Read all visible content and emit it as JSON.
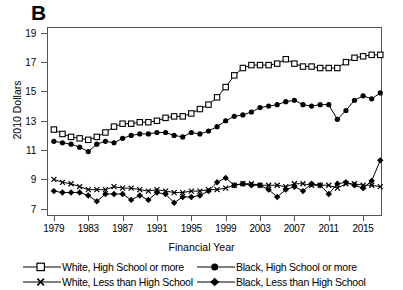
{
  "panel_label": "B",
  "chart_data": {
    "type": "line",
    "title": "B",
    "xlabel": "Financial Year",
    "ylabel": "2010 Dollars",
    "xlim": [
      1978.2,
      2017.2
    ],
    "ylim": [
      6.5,
      19.4
    ],
    "grid": false,
    "legend_position": "bottom",
    "xticks": [
      1979,
      1983,
      1987,
      1991,
      1995,
      1999,
      2003,
      2007,
      2011,
      2015
    ],
    "yticks": [
      7,
      9,
      11,
      13,
      15,
      17,
      19
    ],
    "x": [
      1979,
      1980,
      1981,
      1982,
      1983,
      1984,
      1985,
      1986,
      1987,
      1988,
      1989,
      1990,
      1991,
      1992,
      1993,
      1994,
      1995,
      1996,
      1997,
      1998,
      1999,
      2000,
      2001,
      2002,
      2003,
      2004,
      2005,
      2006,
      2007,
      2008,
      2009,
      2010,
      2011,
      2012,
      2013,
      2014,
      2015,
      2016,
      2017
    ],
    "series": [
      {
        "name": "White, High School or more",
        "marker": "open-square",
        "values": [
          12.4,
          12.1,
          11.9,
          11.8,
          11.7,
          11.9,
          12.2,
          12.6,
          12.8,
          12.8,
          12.9,
          12.9,
          13.0,
          13.2,
          13.3,
          13.3,
          13.5,
          13.8,
          14.1,
          14.6,
          15.3,
          16.1,
          16.6,
          16.8,
          16.8,
          16.8,
          16.9,
          17.2,
          16.9,
          16.7,
          16.7,
          16.6,
          16.6,
          16.6,
          17.0,
          17.3,
          17.4,
          17.5,
          17.5
        ]
      },
      {
        "name": "Black, High School or more",
        "marker": "filled-circle",
        "values": [
          11.6,
          11.5,
          11.4,
          11.2,
          10.9,
          11.4,
          11.6,
          11.5,
          11.8,
          12.0,
          12.1,
          12.1,
          12.2,
          12.2,
          12.0,
          11.9,
          12.2,
          12.1,
          12.3,
          12.6,
          13.0,
          13.3,
          13.4,
          13.6,
          13.9,
          14.0,
          14.1,
          14.3,
          14.4,
          14.1,
          14.0,
          14.1,
          14.1,
          13.1,
          13.7,
          14.4,
          14.7,
          14.5,
          14.9
        ]
      },
      {
        "name": "White, Less than High School",
        "marker": "x-cross",
        "values": [
          9.0,
          8.8,
          8.7,
          8.5,
          8.3,
          8.3,
          8.3,
          8.5,
          8.4,
          8.4,
          8.3,
          8.2,
          8.3,
          8.2,
          8.1,
          8.1,
          8.2,
          8.2,
          8.3,
          8.3,
          8.4,
          8.6,
          8.7,
          8.7,
          8.6,
          8.6,
          8.6,
          8.5,
          8.7,
          8.7,
          8.6,
          8.6,
          8.6,
          8.4,
          8.7,
          8.7,
          8.6,
          8.6,
          8.5
        ]
      },
      {
        "name": "Black, Less than High School",
        "marker": "filled-diamond",
        "values": [
          8.2,
          8.1,
          8.1,
          8.1,
          7.9,
          7.5,
          8.0,
          8.0,
          8.0,
          7.6,
          7.9,
          7.6,
          8.1,
          8.0,
          7.4,
          7.8,
          7.8,
          7.9,
          8.2,
          8.8,
          9.1,
          8.6,
          8.7,
          8.6,
          8.6,
          8.3,
          7.8,
          8.3,
          8.5,
          8.2,
          8.7,
          8.6,
          8.0,
          8.7,
          8.8,
          8.6,
          8.4,
          8.9,
          10.3
        ]
      }
    ]
  },
  "legend": [
    {
      "label": "White, High School or more",
      "marker": "open-square"
    },
    {
      "label": "Black, High School or more",
      "marker": "filled-circle"
    },
    {
      "label": "White, Less than High School",
      "marker": "x-cross"
    },
    {
      "label": "Black, Less than High School",
      "marker": "filled-diamond"
    }
  ]
}
